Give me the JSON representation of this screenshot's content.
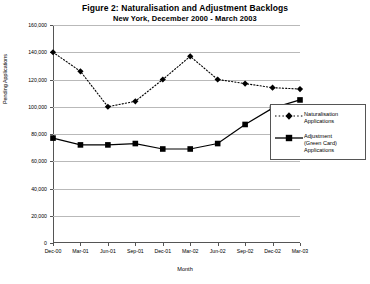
{
  "figure": {
    "title": "Figure 2: Naturalisation and Adjustment Backlogs",
    "subtitle": "New York, December 2000 - March 2003"
  },
  "axes": {
    "xlabel": "Month",
    "ylabel": "Pending Applications"
  },
  "legend": {
    "items": [
      {
        "label": "Naturalisation\nApplications",
        "marker": "diamond",
        "line": "dotted",
        "color": "#000000"
      },
      {
        "label": "Adjustment\n(Green Card)\nApplications",
        "marker": "square",
        "line": "solid",
        "color": "#000000"
      }
    ]
  },
  "chart_data": {
    "type": "line",
    "title": "Figure 2: Naturalisation and Adjustment Backlogs",
    "subtitle": "New York, December 2000 - March 2003",
    "xlabel": "Month",
    "ylabel": "Pending Applications",
    "categories": [
      "Dec-00",
      "Mar-01",
      "Jun-01",
      "Sep-01",
      "Dec-01",
      "Mar-02",
      "Jun-02",
      "Sep-02",
      "Dec-02",
      "Mar-03"
    ],
    "ylim": [
      0,
      160000
    ],
    "yticks": [
      0,
      20000,
      40000,
      60000,
      80000,
      100000,
      120000,
      140000,
      160000
    ],
    "ytick_labels": [
      "0",
      "20,000",
      "40,000",
      "60,000",
      "80,000",
      "100,000",
      "120,000",
      "140,000",
      "160,000"
    ],
    "grid": true,
    "legend_position": "right",
    "series": [
      {
        "name": "Naturalisation Applications",
        "marker": "diamond",
        "linestyle": "dotted",
        "values": [
          140000,
          126000,
          100000,
          104000,
          120000,
          137000,
          120000,
          117000,
          114000,
          113000
        ]
      },
      {
        "name": "Adjustment (Green Card) Applications",
        "marker": "square",
        "linestyle": "solid",
        "values": [
          77000,
          72000,
          72000,
          73000,
          69000,
          69000,
          73000,
          87000,
          99000,
          105000
        ]
      }
    ]
  }
}
